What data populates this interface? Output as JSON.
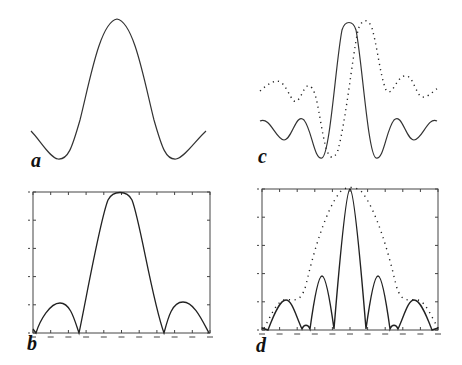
{
  "figure": {
    "panel_labels": [
      "a",
      "b",
      "c",
      "d"
    ]
  },
  "chart_data": [
    {
      "panel": "a",
      "type": "line",
      "title": "",
      "xlabel": "",
      "ylabel": "",
      "axes_visible": false,
      "grid": false,
      "description": "Central lobe with symmetric shallow side minima (amplitude pattern)",
      "series": [
        {
          "name": "amplitude",
          "style": "solid",
          "x": [
            -1.0,
            -0.7,
            -0.5,
            -0.25,
            0.0,
            0.25,
            0.5,
            0.7,
            1.0
          ],
          "y": [
            0.2,
            0.0,
            0.35,
            0.8,
            1.0,
            0.8,
            0.35,
            0.0,
            0.2
          ]
        }
      ]
    },
    {
      "panel": "b",
      "type": "line",
      "title": "",
      "xlabel": "",
      "ylabel": "",
      "axes_visible": true,
      "grid": false,
      "tick_labels_legible": false,
      "x_ticks": 11,
      "y_ticks": 6,
      "ylim": [
        0,
        1
      ],
      "description": "Intensity (squared magnitude): main lobe with two side lobes",
      "series": [
        {
          "name": "intensity",
          "style": "solid",
          "x": [
            -1.0,
            -0.9,
            -0.75,
            -0.52,
            -0.3,
            0.0,
            0.3,
            0.52,
            0.75,
            0.9,
            1.0
          ],
          "y": [
            0.0,
            0.0,
            0.22,
            0.0,
            0.7,
            1.0,
            0.7,
            0.0,
            0.22,
            0.0,
            0.0
          ]
        }
      ]
    },
    {
      "panel": "c",
      "type": "line",
      "title": "",
      "xlabel": "",
      "ylabel": "",
      "axes_visible": false,
      "grid": false,
      "description": "Oscillating sinc-like amplitude (solid) and a shifted/offset version (dotted)",
      "series": [
        {
          "name": "solid",
          "style": "solid",
          "x": [
            -1.0,
            -0.8,
            -0.6,
            -0.4,
            -0.15,
            0.0,
            0.15,
            0.4,
            0.6,
            0.8,
            1.0
          ],
          "y": [
            0.3,
            0.15,
            0.32,
            0.0,
            0.6,
            1.0,
            0.6,
            0.0,
            0.32,
            0.15,
            0.3
          ]
        },
        {
          "name": "dotted",
          "style": "dotted",
          "x": [
            -1.0,
            -0.8,
            -0.6,
            -0.45,
            -0.2,
            0.1,
            0.3,
            0.55,
            0.75,
            1.0
          ],
          "y": [
            0.52,
            0.58,
            0.4,
            0.55,
            0.0,
            0.98,
            0.55,
            0.5,
            0.6,
            0.45
          ]
        }
      ]
    },
    {
      "panel": "d",
      "type": "line",
      "title": "",
      "xlabel": "",
      "ylabel": "",
      "axes_visible": true,
      "grid": false,
      "tick_labels_legible": false,
      "x_ticks": 11,
      "y_ticks": 6,
      "ylim": [
        0,
        1
      ],
      "description": "Narrower intensity pattern with multiple side lobes (solid) under a broad envelope (dotted)",
      "series": [
        {
          "name": "solid",
          "style": "solid",
          "x": [
            -1.0,
            -0.92,
            -0.72,
            -0.55,
            -0.48,
            -0.41,
            -0.2,
            -0.02,
            0.0,
            0.02,
            0.2,
            0.41,
            0.48,
            0.55,
            0.72,
            0.92,
            1.0
          ],
          "y": [
            0.0,
            0.0,
            0.2,
            0.0,
            0.03,
            0.0,
            0.38,
            0.0,
            1.0,
            0.0,
            0.38,
            0.0,
            0.03,
            0.0,
            0.2,
            0.0,
            0.0
          ]
        },
        {
          "name": "dotted-envelope",
          "style": "dotted",
          "x": [
            -1.0,
            -0.8,
            -0.6,
            -0.4,
            -0.2,
            0.0,
            0.2,
            0.4,
            0.6,
            0.8,
            1.0
          ],
          "y": [
            0.0,
            0.2,
            0.15,
            0.15,
            0.7,
            1.0,
            0.7,
            0.15,
            0.15,
            0.2,
            0.0
          ]
        }
      ]
    }
  ]
}
